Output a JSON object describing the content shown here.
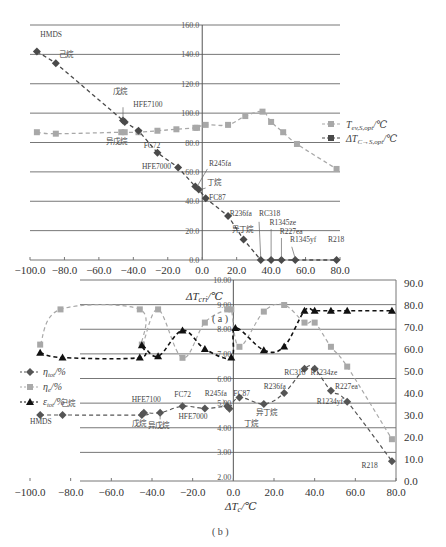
{
  "chart_data": [
    {
      "id": "a",
      "type": "line",
      "caption": "( a )",
      "xlabel": "ΔT_cri/℃",
      "xlim": [
        -100,
        80
      ],
      "x_ticks": [
        "−100.0",
        "−80.0",
        "−60.0",
        "−40.0",
        "−20.0",
        "0.0",
        "20.0",
        "40.0",
        "60.0",
        "80.0"
      ],
      "ylim": [
        0,
        160
      ],
      "y_ticks": [
        "0.0",
        "20.0",
        "40.0",
        "60.0",
        "80.0",
        "100.0",
        "120.0",
        "140.0",
        "160.0"
      ],
      "grid": true,
      "legend_position": "right",
      "series": [
        {
          "name": "T_ev,S,opt/℃",
          "marker": "square",
          "color": "#a8a8a8",
          "points": [
            {
              "x": -96,
              "y": 87
            },
            {
              "x": -85,
              "y": 86
            },
            {
              "x": -47,
              "y": 87
            },
            {
              "x": -45,
              "y": 87
            },
            {
              "x": -37,
              "y": 87
            },
            {
              "x": -26,
              "y": 88
            },
            {
              "x": -15,
              "y": 89
            },
            {
              "x": -4,
              "y": 90
            },
            {
              "x": -3,
              "y": 90
            },
            {
              "x": 2,
              "y": 92
            },
            {
              "x": 15,
              "y": 92
            },
            {
              "x": 25,
              "y": 98
            },
            {
              "x": 35,
              "y": 101
            },
            {
              "x": 40,
              "y": 94
            },
            {
              "x": 47,
              "y": 87
            },
            {
              "x": 55,
              "y": 79
            },
            {
              "x": 78,
              "y": 62
            }
          ]
        },
        {
          "name": "ΔT_C→S,opt/℃",
          "marker": "diamond",
          "color": "#4a4a4a",
          "points": [
            {
              "x": -96,
              "y": 142,
              "label": "HMDS"
            },
            {
              "x": -85,
              "y": 134,
              "label": "己烷"
            },
            {
              "x": -46,
              "y": 95,
              "label": "戊烷"
            },
            {
              "x": -45,
              "y": 94,
              "label": "HFE7100"
            },
            {
              "x": -37,
              "y": 88,
              "label": "异戊烷"
            },
            {
              "x": -26,
              "y": 73,
              "label": "FC72"
            },
            {
              "x": -14,
              "y": 63,
              "label": "HFE7000"
            },
            {
              "x": -4,
              "y": 50,
              "label": "R245fa"
            },
            {
              "x": -2,
              "y": 48,
              "label": "丁烷"
            },
            {
              "x": 2,
              "y": 42,
              "label": "FC87"
            },
            {
              "x": 15,
              "y": 30,
              "label": "R236fa"
            },
            {
              "x": 24,
              "y": 14,
              "label": "异丁烷"
            },
            {
              "x": 34,
              "y": 0,
              "label": "RC318"
            },
            {
              "x": 40,
              "y": 0,
              "label": "R1345ze"
            },
            {
              "x": 46,
              "y": 0,
              "label": "R227ea"
            },
            {
              "x": 54,
              "y": 0,
              "label": "R1345yf"
            },
            {
              "x": 78,
              "y": 0,
              "label": "R218"
            }
          ]
        }
      ]
    },
    {
      "id": "b",
      "type": "line",
      "caption": "( b )",
      "xlabel": "ΔT_c/℃",
      "xlim": [
        -100,
        80
      ],
      "x_ticks": [
        "−100.0",
        "−80.0",
        "−60.0",
        "−40.0",
        "−20.0",
        "0.0",
        "20.0",
        "40.0",
        "60.0",
        "80.0"
      ],
      "ylim_left": [
        2,
        10
      ],
      "y_ticks_left": [
        "2.00",
        "3.00",
        "4.00",
        "5.00",
        "6.00",
        "7.00",
        "8.00",
        "9.00",
        "10.00"
      ],
      "ylim_right": [
        0,
        90
      ],
      "y_ticks_right": [
        "0.0",
        "10.0",
        "20.0",
        "30.0",
        "40.0",
        "50.0",
        "60.0",
        "70.0",
        "80.0",
        "90.0"
      ],
      "grid": true,
      "legend_position": "left",
      "series": [
        {
          "name": "η_tot/%",
          "marker": "diamond",
          "color": "#555555",
          "axis": "right",
          "points": [
            {
              "x": -95,
              "y": 30,
              "label": "HMDS"
            },
            {
              "x": -84,
              "y": 30,
              "label": "己烷"
            },
            {
              "x": -45,
              "y": 30,
              "label": "戊烷"
            },
            {
              "x": -44,
              "y": 31,
              "label": "HFE7100"
            },
            {
              "x": -36,
              "y": 31,
              "label": "异戊烷"
            },
            {
              "x": -25,
              "y": 34,
              "label": "FC72"
            },
            {
              "x": -14,
              "y": 33,
              "label": "HFE7000"
            },
            {
              "x": -3,
              "y": 34,
              "label": "R245fa"
            },
            {
              "x": -2,
              "y": 33,
              "label": "丁烷"
            },
            {
              "x": 3,
              "y": 38,
              "label": "FC87"
            },
            {
              "x": 15,
              "y": 35,
              "label": "异丁烷"
            },
            {
              "x": 25,
              "y": 40,
              "label": "R236fa"
            },
            {
              "x": 35,
              "y": 51,
              "label": "RC318"
            },
            {
              "x": 40,
              "y": 51,
              "label": "R1234ze"
            },
            {
              "x": 48,
              "y": 41,
              "label": "R227ea"
            },
            {
              "x": 56,
              "y": 36,
              "label": "R1234yf"
            },
            {
              "x": 78,
              "y": 9,
              "label": "R218"
            }
          ]
        },
        {
          "name": "η_e/%",
          "marker": "square",
          "color": "#a8a8a8",
          "axis": "right",
          "points": [
            {
              "x": -95,
              "y": 62
            },
            {
              "x": -85,
              "y": 78
            },
            {
              "x": -46,
              "y": 78
            },
            {
              "x": -45,
              "y": 62
            },
            {
              "x": -37,
              "y": 78
            },
            {
              "x": -25,
              "y": 56
            },
            {
              "x": -14,
              "y": 72
            },
            {
              "x": -3,
              "y": 78
            },
            {
              "x": -1,
              "y": 78
            },
            {
              "x": 3,
              "y": 61
            },
            {
              "x": 15,
              "y": 77
            },
            {
              "x": 25,
              "y": 80
            },
            {
              "x": 35,
              "y": 72
            },
            {
              "x": 40,
              "y": 72
            },
            {
              "x": 48,
              "y": 61
            },
            {
              "x": 56,
              "y": 52
            },
            {
              "x": 78,
              "y": 19
            }
          ]
        },
        {
          "name": "ε_tot/%",
          "marker": "triangle",
          "color": "#111111",
          "axis": "left",
          "points": [
            {
              "x": -95,
              "y": 7.05
            },
            {
              "x": -84,
              "y": 6.85
            },
            {
              "x": -46,
              "y": 6.85
            },
            {
              "x": -45,
              "y": 7.35
            },
            {
              "x": -37,
              "y": 6.9
            },
            {
              "x": -25,
              "y": 7.95
            },
            {
              "x": -14,
              "y": 7.2
            },
            {
              "x": -1,
              "y": 6.85
            },
            {
              "x": 1,
              "y": 8.05
            },
            {
              "x": 15,
              "y": 7.15
            },
            {
              "x": 25,
              "y": 7.3
            },
            {
              "x": 35,
              "y": 8.75
            },
            {
              "x": 40,
              "y": 8.75
            },
            {
              "x": 48,
              "y": 8.75
            },
            {
              "x": 56,
              "y": 8.75
            },
            {
              "x": 78,
              "y": 8.75
            }
          ]
        }
      ]
    }
  ],
  "legend_a": {
    "item1": "T",
    "item1_sub": "ev,S,opt",
    "item1_tail": "/℃",
    "item2": "ΔT",
    "item2_sub": "C→S,opt",
    "item2_tail": "/℃"
  },
  "legend_b": {
    "item1": "η",
    "item1_sub": "tot",
    "item1_tail": "/%",
    "item2": "η",
    "item2_sub": "e",
    "item2_tail": "/%",
    "item3": "ε",
    "item3_sub": "tot",
    "item3_tail": "/%"
  },
  "axis_titles": {
    "a_x_main": "ΔT",
    "a_x_sub": "cri",
    "a_x_tail": "/℃",
    "b_x_main": "ΔT",
    "b_x_sub": "c",
    "b_x_tail": "/℃"
  },
  "captions": {
    "a": "( a )",
    "b": "( b )"
  }
}
